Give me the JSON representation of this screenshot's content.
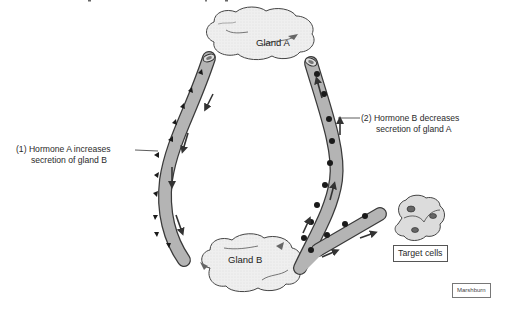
{
  "diagram": {
    "type": "negative-feedback-loop",
    "nodes": {
      "gland_a": {
        "label": "Gland A"
      },
      "gland_b": {
        "label": "Gland B"
      },
      "target_cells": {
        "label": "Target cells"
      }
    },
    "annotations": {
      "hormone_a": {
        "line1": "(1)  Hormone A increases",
        "line2": "secretion of gland B"
      },
      "hormone_b": {
        "line1": "(2) Hormone B decreases",
        "line2": "secretion of gland A"
      }
    },
    "vessels": [
      {
        "name": "vessel-hormone-a",
        "from": "gland_a",
        "to": "gland_b",
        "marker": "triangle"
      },
      {
        "name": "vessel-hormone-b",
        "from": "gland_b",
        "to": "gland_a",
        "marker": "dot"
      },
      {
        "name": "vessel-to-target",
        "from": "gland_b",
        "to": "target_cells",
        "marker": "dot"
      }
    ],
    "credit": "Marshburn",
    "colors": {
      "vessel_fill": "#b4b4b4",
      "vessel_stroke": "#3a3a3a",
      "gland_fill": "#ececec",
      "marker": "#1a1a1a",
      "arrow": "#3a3a3a"
    }
  }
}
